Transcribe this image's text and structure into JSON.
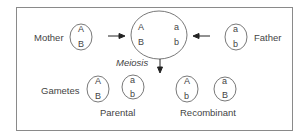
{
  "diagram": {
    "type": "genetics-meiosis-recombination",
    "labels": {
      "mother": "Mother",
      "father": "Father",
      "meiosis": "Meiosis",
      "gametes": "Gametes",
      "parental": "Parental",
      "recombinant": "Recombinant"
    },
    "mother_chromosome": {
      "top": "A",
      "bottom": "B"
    },
    "father_chromosome": {
      "top": "a",
      "bottom": "b"
    },
    "zygote": {
      "left_top": "A",
      "left_bottom": "B",
      "right_top": "a",
      "right_bottom": "b"
    },
    "gametes": [
      {
        "group": "parental",
        "top": "A",
        "bottom": "B"
      },
      {
        "group": "parental",
        "top": "a",
        "bottom": "b"
      },
      {
        "group": "recombinant",
        "top": "A",
        "bottom": "b"
      },
      {
        "group": "recombinant",
        "top": "a",
        "bottom": "B"
      }
    ],
    "colors": {
      "stroke": "#555555",
      "text": "#444444",
      "frame": "#8a8a8a"
    }
  }
}
